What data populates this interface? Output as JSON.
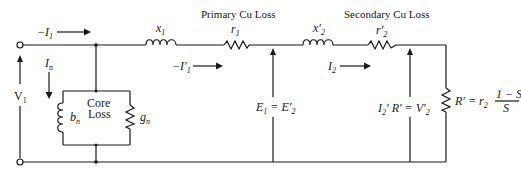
{
  "diagram": {
    "type": "equivalent-circuit",
    "headers": {
      "primary_loss": "Primary Cu Loss",
      "secondary_loss": "Secondary Cu Loss",
      "core_loss_line1": "Core",
      "core_loss_line2": "Loss"
    },
    "components": {
      "x1": {
        "base": "x",
        "sub": "1"
      },
      "r1": {
        "base": "r",
        "sub": "1"
      },
      "x2p": {
        "base": "x′",
        "sub": "2"
      },
      "r2p": {
        "base": "r′",
        "sub": "2"
      },
      "bn": {
        "base": "b",
        "sub": "n"
      },
      "gn": {
        "base": "g",
        "sub": "n"
      }
    },
    "currents": {
      "i1": {
        "prefix": "−",
        "base": "I",
        "sub": "1"
      },
      "in": {
        "base": "I",
        "sub": "n"
      },
      "i1p": {
        "prefix": "−",
        "base": "I′",
        "sub": "1"
      },
      "i2": {
        "base": "I",
        "sub": "2"
      }
    },
    "voltages": {
      "v1": {
        "base": "V",
        "sub": "1"
      },
      "e1": {
        "left_base": "E",
        "left_sub": "1",
        "eq": " = ",
        "right_base": "E′",
        "right_sub": "2"
      },
      "v2p": {
        "left": "I",
        "left_sub": "2",
        "mid": "′ R′ = ",
        "right_base": "V′",
        "right_sub": "2"
      }
    },
    "load": {
      "lhs": "R′ = r",
      "lhs_sub": "2",
      "numerator": "1 − S",
      "denominator": "S"
    }
  }
}
